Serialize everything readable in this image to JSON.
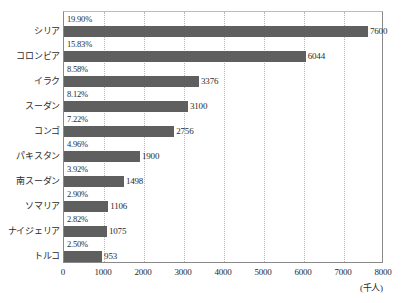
{
  "chart_data": {
    "type": "bar",
    "orientation": "horizontal",
    "title": "",
    "xlabel": "(千人)",
    "ylabel": "",
    "xlim": [
      0,
      8000
    ],
    "xticks": [
      0,
      1000,
      2000,
      3000,
      4000,
      5000,
      6000,
      7000,
      8000
    ],
    "xticklabels": [
      "0",
      "1000",
      "2000",
      "3000",
      "4000",
      "5000",
      "6000",
      "7000",
      "8000"
    ],
    "grid": true,
    "grid_axis": "x",
    "legend": false,
    "bar_color": "#5f5f5f",
    "categories": [
      "シリア",
      "コロンビア",
      "イラク",
      "スーダン",
      "コンゴ",
      "パキスタン",
      "南スーダン",
      "ソマリア",
      "ナイジェリア",
      "トルコ"
    ],
    "values": [
      7600,
      6044,
      3376,
      3100,
      2756,
      1900,
      1498,
      1106,
      1075,
      953
    ],
    "value_labels": [
      "7600",
      "6044",
      "3376",
      "3100",
      "2756",
      "1900",
      "1498",
      "1106",
      "1075",
      "953"
    ],
    "percent_labels": [
      "19.90%",
      "15.83%",
      "8.58%",
      "8.12%",
      "7.22%",
      "4.96%",
      "3.92%",
      "2.90%",
      "2.82%",
      "2.50%"
    ]
  }
}
